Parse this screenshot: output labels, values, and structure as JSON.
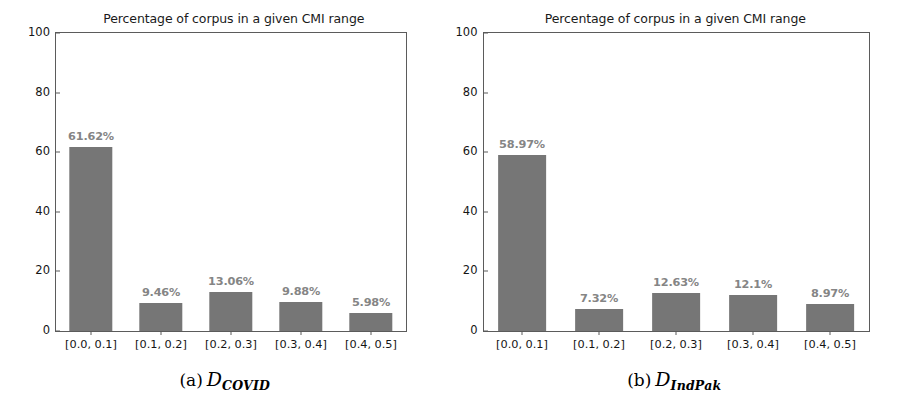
{
  "figure": {
    "panels": [
      {
        "id": "panel-a",
        "title": "Percentage of corpus in a given CMI range",
        "caption_letter": "(a)",
        "caption_symbol": "D",
        "caption_subscript": "COVID",
        "chart_data": {
          "type": "bar",
          "title": "Percentage of corpus in a given CMI range",
          "xlabel": "",
          "ylabel": "",
          "categories": [
            "[0.0, 0.1]",
            "[0.1, 0.2]",
            "[0.2, 0.3]",
            "[0.3, 0.4]",
            "[0.4, 0.5]"
          ],
          "values": [
            61.62,
            9.46,
            13.06,
            9.88,
            5.98
          ],
          "data_labels": [
            "61.62%",
            "9.46%",
            "13.06%",
            "9.88%",
            "5.98%"
          ],
          "ylim": [
            0,
            100
          ],
          "yticks": [
            0,
            20,
            40,
            60,
            80,
            100
          ],
          "ytick_labels": [
            "0",
            "20",
            "40",
            "60",
            "80",
            "100"
          ],
          "grid": false,
          "legend": "none",
          "bar_color": "#767676",
          "label_color": "#858585"
        }
      },
      {
        "id": "panel-b",
        "title": "Percentage of corpus in a given CMI range",
        "caption_letter": "(b)",
        "caption_symbol": "D",
        "caption_subscript": "IndPak",
        "chart_data": {
          "type": "bar",
          "title": "Percentage of corpus in a given CMI range",
          "xlabel": "",
          "ylabel": "",
          "categories": [
            "[0.0, 0.1]",
            "[0.1, 0.2]",
            "[0.2, 0.3]",
            "[0.3, 0.4]",
            "[0.4, 0.5]"
          ],
          "values": [
            58.97,
            7.32,
            12.63,
            12.1,
            8.97
          ],
          "data_labels": [
            "58.97%",
            "7.32%",
            "12.63%",
            "12.1%",
            "8.97%"
          ],
          "ylim": [
            0,
            100
          ],
          "yticks": [
            0,
            20,
            40,
            60,
            80,
            100
          ],
          "ytick_labels": [
            "0",
            "20",
            "40",
            "60",
            "80",
            "100"
          ],
          "grid": false,
          "legend": "none",
          "bar_color": "#767676",
          "label_color": "#858585"
        }
      }
    ]
  }
}
